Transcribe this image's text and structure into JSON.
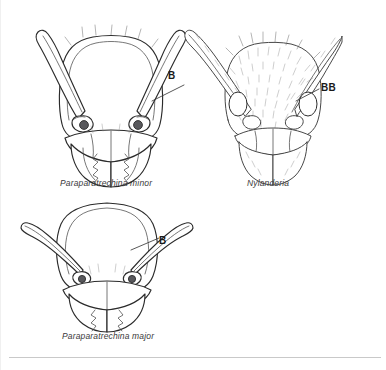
{
  "page": {
    "background_color": "#ffffff",
    "ink_color": "#2b2b2b",
    "divider_color": "#c9c9c9"
  },
  "figures": [
    {
      "id": "paraparatrechina-minor",
      "caption": "Paraparatrechina minor",
      "callout": "B",
      "callout_meaning": "bristle",
      "description": "Full-face view of ant head with sparse erect setae on head margin"
    },
    {
      "id": "nylanderia",
      "caption": "Nylanderia",
      "callout": "BB",
      "callout_meaning": "paired bristles",
      "description": "Full-face view of ant head densely covered with fine setae"
    },
    {
      "id": "paraparatrechina-major",
      "caption": "Paraparatrechina major",
      "callout": "B",
      "callout_meaning": "bristle",
      "description": "Full-face view of broad major worker ant head"
    }
  ]
}
